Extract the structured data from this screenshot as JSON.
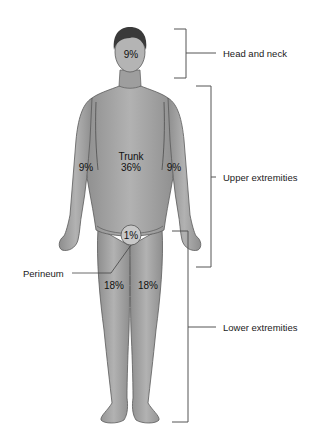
{
  "figure": {
    "colors": {
      "skin": "#a9a9a9",
      "skin_dark": "#7a7a7a",
      "hair": "#3a3a3a",
      "outline": "#555555",
      "bracket": "#555555",
      "text": "#1a1a1a"
    }
  },
  "regions": {
    "head": {
      "percent": "9%"
    },
    "trunk": {
      "name": "Trunk",
      "percent": "36%"
    },
    "left_arm": {
      "percent": "9%"
    },
    "right_arm": {
      "percent": "9%"
    },
    "perineum": {
      "name": "Perineum",
      "percent": "1%"
    },
    "left_leg": {
      "percent": "18%"
    },
    "right_leg": {
      "percent": "18%"
    }
  },
  "brackets": [
    {
      "label": "Head and neck"
    },
    {
      "label": "Upper extremities"
    },
    {
      "label": "Lower extremities"
    }
  ]
}
